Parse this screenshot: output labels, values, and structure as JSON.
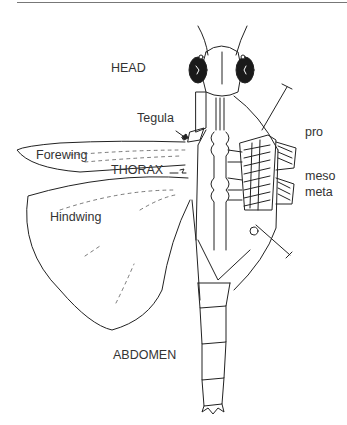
{
  "figure": {
    "labels": {
      "head": "HEAD",
      "tegula": "Tegula",
      "forewing": "Forewing",
      "thorax": "THORAX",
      "hindwing": "Hindwing",
      "pro": "pro",
      "meso": "meso",
      "meta": "meta",
      "abdomen": "ABDOMEN"
    },
    "colors": {
      "ink": "#222222",
      "text": "#333333",
      "eye_fill": "#1a1a1a",
      "background": "#ffffff"
    }
  }
}
